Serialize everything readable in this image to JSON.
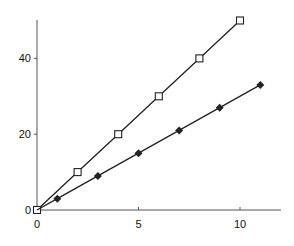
{
  "chart_data": {
    "type": "line",
    "title": "",
    "xlabel": "",
    "ylabel": "",
    "xlim": [
      0,
      12
    ],
    "ylim": [
      0,
      50
    ],
    "grid": false,
    "legend": null,
    "x_ticks": [
      "0",
      "5",
      "10"
    ],
    "y_ticks": [
      "0",
      "20",
      "40"
    ],
    "series": [
      {
        "name": "open-square-series",
        "marker": "open-square",
        "color": "#222222",
        "x": [
          0,
          2,
          4,
          6,
          8,
          10
        ],
        "y": [
          0,
          10,
          20,
          30,
          40,
          50
        ]
      },
      {
        "name": "filled-diamond-series",
        "marker": "filled-diamond",
        "color": "#222222",
        "x": [
          0,
          1,
          3,
          5,
          7,
          9,
          11
        ],
        "y": [
          0,
          3,
          9,
          15,
          21,
          27,
          33
        ]
      }
    ]
  }
}
